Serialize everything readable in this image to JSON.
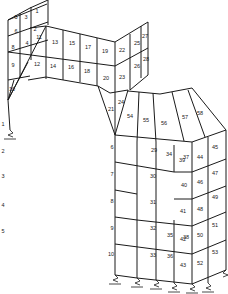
{
  "diagram": {
    "type": "finite-element structural mesh",
    "line_color": "#1a1a1a",
    "background": "#ffffff",
    "elements": [
      {
        "id": "1",
        "x": 37,
        "y": 12
      },
      {
        "id": "2",
        "x": 35,
        "y": 30
      },
      {
        "id": "3",
        "x": 26,
        "y": 18
      },
      {
        "id": "4",
        "x": 27,
        "y": 44
      },
      {
        "id": "5",
        "x": 16,
        "y": 18
      },
      {
        "id": "6",
        "x": 16,
        "y": 32
      },
      {
        "id": "8",
        "x": 13,
        "y": 48
      },
      {
        "id": "9",
        "x": 13,
        "y": 66
      },
      {
        "id": "10",
        "x": 12,
        "y": 90
      },
      {
        "id": "11",
        "x": 39,
        "y": 38
      },
      {
        "id": "12",
        "x": 37,
        "y": 65
      },
      {
        "id": "13",
        "x": 55,
        "y": 43
      },
      {
        "id": "14",
        "x": 53,
        "y": 67
      },
      {
        "id": "15",
        "x": 72,
        "y": 44
      },
      {
        "id": "16",
        "x": 71,
        "y": 68
      },
      {
        "id": "17",
        "x": 88,
        "y": 48
      },
      {
        "id": "18",
        "x": 87,
        "y": 72
      },
      {
        "id": "19",
        "x": 105,
        "y": 52
      },
      {
        "id": "20",
        "x": 106,
        "y": 79
      },
      {
        "id": "21",
        "x": 111,
        "y": 110
      },
      {
        "id": "22",
        "x": 122,
        "y": 51
      },
      {
        "id": "23",
        "x": 122,
        "y": 78
      },
      {
        "id": "24",
        "x": 121,
        "y": 103
      },
      {
        "id": "25",
        "x": 137,
        "y": 44
      },
      {
        "id": "26",
        "x": 137,
        "y": 67
      },
      {
        "id": "27",
        "x": 145,
        "y": 37
      },
      {
        "id": "28",
        "x": 146,
        "y": 60
      },
      {
        "id": "29",
        "x": 154,
        "y": 151
      },
      {
        "id": "30",
        "x": 153,
        "y": 177
      },
      {
        "id": "31",
        "x": 153,
        "y": 203
      },
      {
        "id": "32",
        "x": 153,
        "y": 229
      },
      {
        "id": "33",
        "x": 153,
        "y": 256
      },
      {
        "id": "34",
        "x": 169,
        "y": 155
      },
      {
        "id": "35",
        "x": 170,
        "y": 236
      },
      {
        "id": "36",
        "x": 170,
        "y": 257
      },
      {
        "id": "37",
        "x": 186,
        "y": 158
      },
      {
        "id": "38",
        "x": 186,
        "y": 238
      },
      {
        "id": "39",
        "x": 182,
        "y": 161
      },
      {
        "id": "40",
        "x": 184,
        "y": 186
      },
      {
        "id": "41",
        "x": 183,
        "y": 212
      },
      {
        "id": "42",
        "x": 183,
        "y": 240
      },
      {
        "id": "43",
        "x": 183,
        "y": 266
      },
      {
        "id": "44",
        "x": 200,
        "y": 158
      },
      {
        "id": "45",
        "x": 215,
        "y": 148
      },
      {
        "id": "46",
        "x": 200,
        "y": 183
      },
      {
        "id": "47",
        "x": 215,
        "y": 174
      },
      {
        "id": "48",
        "x": 200,
        "y": 210
      },
      {
        "id": "49",
        "x": 215,
        "y": 198
      },
      {
        "id": "50",
        "x": 200,
        "y": 236
      },
      {
        "id": "51",
        "x": 215,
        "y": 226
      },
      {
        "id": "52",
        "x": 200,
        "y": 264
      },
      {
        "id": "53",
        "x": 215,
        "y": 253
      },
      {
        "id": "54",
        "x": 130,
        "y": 117
      },
      {
        "id": "55",
        "x": 146,
        "y": 121
      },
      {
        "id": "56",
        "x": 164,
        "y": 124
      },
      {
        "id": "57",
        "x": 185,
        "y": 118
      },
      {
        "id": "58",
        "x": 200,
        "y": 114
      }
    ],
    "member_labels": [
      {
        "id": "1",
        "x": 3,
        "y": 125
      },
      {
        "id": "2",
        "x": 3,
        "y": 152
      },
      {
        "id": "3",
        "x": 3,
        "y": 177
      },
      {
        "id": "4",
        "x": 3,
        "y": 206
      },
      {
        "id": "5",
        "x": 3,
        "y": 232
      },
      {
        "id": "6",
        "x": 112,
        "y": 148
      },
      {
        "id": "7",
        "x": 112,
        "y": 175
      },
      {
        "id": "8",
        "x": 112,
        "y": 202
      },
      {
        "id": "9",
        "x": 112,
        "y": 229
      },
      {
        "id": "10",
        "x": 111,
        "y": 255
      }
    ]
  }
}
